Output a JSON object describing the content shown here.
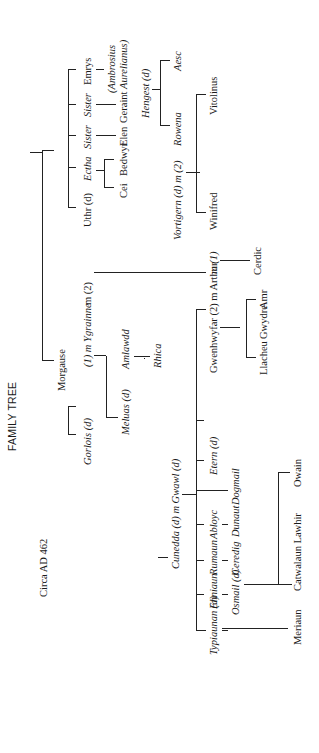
{
  "diagram": {
    "title": "FAMILY TREE",
    "date_label": "Circa AD 462",
    "orientation": "rotated 90 degrees counter-clockwise",
    "people": {
      "uthr": "Uthr (d)",
      "ectha": "Ectha",
      "sister1": "Sister",
      "sister2": "Sister",
      "emrys": "Emrys",
      "cei": "Cei",
      "bedwyr": "Bedwyr",
      "elen": "Elen",
      "geraint": "Geraint",
      "ambrosius_line1": "(Ambrosius",
      "ambrosius_line2": "Aurelianus)",
      "hengest": "Hengest (d)",
      "aesc": "Aesc",
      "vortigern": "Vortigern (d) m (2)",
      "rowena": "Rowena",
      "winifred": "Winifred",
      "vitolinus": "Vitolinus",
      "morgause": "Morgause",
      "ygrainne": "(1) m Ygrainne",
      "ygrainne_m2": "m (2)",
      "amlawdd": "Amlawdd",
      "rhica": "Rhica",
      "gorlois": "Gorlois (d)",
      "meluas": "Meluas (d)",
      "gwenhwyfar_arthur": "Gwenhwyfar (2) m Arthur",
      "arthur_m1": "m (1)",
      "cerdic": "Cerdic",
      "llacheu": "Llacheu",
      "gwydre": "Gwydre",
      "amr": "Amr",
      "cunedda": "Cunedda (d) m Gwawl (d)",
      "typiaunan": "Typiaunan (d)",
      "enniaun": "Enniaun",
      "rumaun": "Rumaun",
      "abloyc": "Abloyc",
      "etern": "Etern (d)",
      "osmail": "Osmail (d)",
      "ceredig": "Ceredig",
      "dunaut": "Dunaut",
      "dogmail": "Dogmail",
      "meriaun": "Meriaun",
      "catwalaun": "Catwalaun Lawhir",
      "owain": "Owain"
    },
    "colors": {
      "ink": "#1a1a1a",
      "background": "#ffffff"
    }
  }
}
